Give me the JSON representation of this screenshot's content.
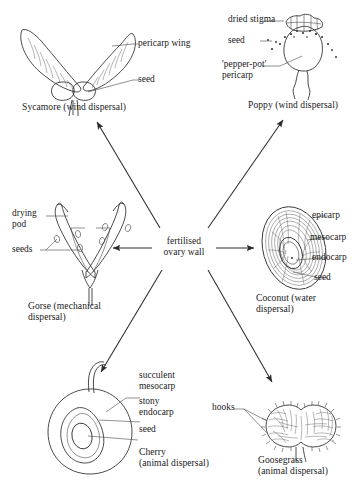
{
  "diagram": {
    "center": {
      "label": "fertilised\novary wall",
      "name": "center-node"
    },
    "background_color": "#ffffff",
    "ink_color": "#2b2b2b",
    "nodes": [
      {
        "id": "sycamore",
        "caption": "Sycamore (wind dispersal)",
        "labels": [
          {
            "text": "pericarp wing"
          },
          {
            "text": "seed"
          }
        ]
      },
      {
        "id": "poppy",
        "caption": "Poppy (wind dispersal)",
        "labels": [
          {
            "text": "dried stigma"
          },
          {
            "text": "seed"
          },
          {
            "text": "'pepper-pot'\npericarp"
          }
        ]
      },
      {
        "id": "gorse",
        "caption": "Gorse (mechanical\ndispersal)",
        "labels": [
          {
            "text": "drying\npod"
          },
          {
            "text": "seeds"
          }
        ]
      },
      {
        "id": "coconut",
        "caption": "Coconut (water\ndispersal)",
        "labels": [
          {
            "text": "epicarp"
          },
          {
            "text": "mesocarp"
          },
          {
            "text": "endocarp"
          },
          {
            "text": "seed"
          }
        ]
      },
      {
        "id": "cherry",
        "caption": "Cherry\n(animal dispersal)",
        "labels": [
          {
            "text": "succulent\nmesocarp"
          },
          {
            "text": "stony\nendocarp"
          },
          {
            "text": "seed"
          }
        ]
      },
      {
        "id": "goosegrass",
        "caption": "Goosegrass\n(animal dispersal)",
        "labels": [
          {
            "text": "hooks"
          }
        ]
      }
    ],
    "arrows": [
      {
        "id": "arrow-up-left",
        "from": "center",
        "to": "sycamore"
      },
      {
        "id": "arrow-up-right",
        "from": "center",
        "to": "poppy"
      },
      {
        "id": "arrow-left",
        "from": "center",
        "to": "gorse"
      },
      {
        "id": "arrow-right",
        "from": "center",
        "to": "coconut"
      },
      {
        "id": "arrow-down-left",
        "from": "center",
        "to": "cherry"
      },
      {
        "id": "arrow-down-right",
        "from": "center",
        "to": "goosegrass"
      }
    ]
  }
}
